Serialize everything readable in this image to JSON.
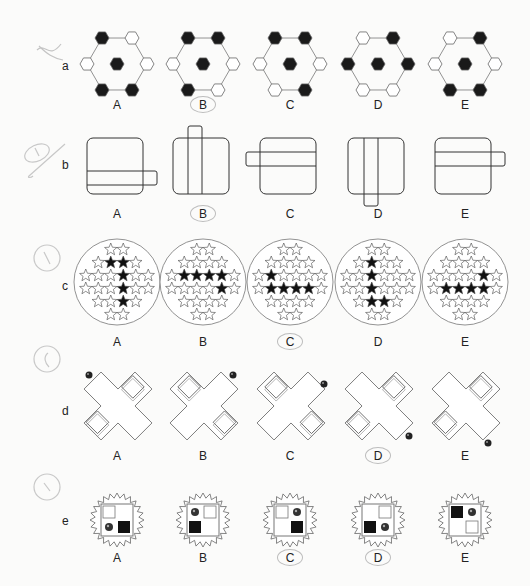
{
  "page": {
    "type": "non-verbal reasoning test page",
    "pencil_marks": {
      "a": "cross",
      "b": "circled 1 with slash",
      "c": "circled 1",
      "d": "circled 1",
      "e": "circled 1"
    }
  },
  "questions": [
    {
      "id": "a",
      "label": "a",
      "kind": "hexagon-ring",
      "circled_answer": "B",
      "options": [
        {
          "label": "A",
          "ring": [
            1,
            0,
            0,
            1,
            1,
            0
          ],
          "center": 1
        },
        {
          "label": "B",
          "ring": [
            1,
            1,
            0,
            0,
            1,
            0
          ],
          "center": 1
        },
        {
          "label": "C",
          "ring": [
            1,
            1,
            0,
            1,
            0,
            0
          ],
          "center": 1
        },
        {
          "label": "D",
          "ring": [
            0,
            1,
            1,
            0,
            0,
            1
          ],
          "center": 1
        },
        {
          "label": "E",
          "ring": [
            0,
            1,
            0,
            1,
            1,
            0
          ],
          "center": 1
        }
      ]
    },
    {
      "id": "b",
      "label": "b",
      "kind": "square-with-band",
      "circled_answer": "B",
      "secondary_mark": "E",
      "options": [
        {
          "label": "A",
          "band": "horizontal-low-right"
        },
        {
          "label": "B",
          "band": "vertical-center-top"
        },
        {
          "label": "C",
          "band": "horizontal-high-left"
        },
        {
          "label": "D",
          "band": "vertical-center-bottom"
        },
        {
          "label": "E",
          "band": "horizontal-high-right"
        }
      ]
    },
    {
      "id": "c",
      "label": "c",
      "kind": "star-grid",
      "circled_answer": "C",
      "secondary_mark": "B",
      "row_sizes": [
        2,
        4,
        6,
        6,
        4,
        2
      ],
      "options": [
        {
          "label": "A",
          "black": [
            [
              1,
              1
            ],
            [
              1,
              2
            ],
            [
              2,
              3
            ],
            [
              3,
              3
            ],
            [
              4,
              2
            ]
          ]
        },
        {
          "label": "B",
          "black": [
            [
              2,
              1
            ],
            [
              2,
              2
            ],
            [
              2,
              3
            ],
            [
              2,
              4
            ],
            [
              3,
              4
            ]
          ]
        },
        {
          "label": "C",
          "black": [
            [
              2,
              1
            ],
            [
              3,
              1
            ],
            [
              3,
              2
            ],
            [
              3,
              3
            ],
            [
              3,
              4
            ]
          ]
        },
        {
          "label": "D",
          "black": [
            [
              1,
              1
            ],
            [
              2,
              2
            ],
            [
              3,
              2
            ],
            [
              4,
              1
            ],
            [
              4,
              2
            ]
          ]
        },
        {
          "label": "E",
          "black": [
            [
              2,
              4
            ],
            [
              3,
              1
            ],
            [
              3,
              2
            ],
            [
              3,
              3
            ],
            [
              3,
              4
            ]
          ]
        }
      ]
    },
    {
      "id": "d",
      "label": "d",
      "kind": "cross-with-ball",
      "circled_answer": "D",
      "secondary_mark": "B",
      "options": [
        {
          "label": "A",
          "ball": "top-left",
          "squares": [
            "top-right",
            "bottom-left"
          ]
        },
        {
          "label": "B",
          "ball": "top-right",
          "squares": [
            "top-left",
            "bottom-right"
          ]
        },
        {
          "label": "C",
          "ball": "right-top",
          "squares": [
            "top-left",
            "bottom-right"
          ]
        },
        {
          "label": "D",
          "ball": "bottom-right",
          "squares": [
            "top-right",
            "bottom-left"
          ]
        },
        {
          "label": "E",
          "ball": "bottom-right-low",
          "squares": [
            "top-right",
            "bottom-left"
          ]
        }
      ]
    },
    {
      "id": "e",
      "label": "e",
      "kind": "zigzag-badge",
      "circled_answer": "D",
      "secondary_mark": "C",
      "options": [
        {
          "label": "A",
          "cells": {
            "tl": "white",
            "tr": "empty",
            "bl": "ball",
            "br": "black"
          }
        },
        {
          "label": "B",
          "cells": {
            "tl": "ball",
            "tr": "white",
            "bl": "black",
            "br": "empty"
          }
        },
        {
          "label": "C",
          "cells": {
            "tl": "white",
            "tr": "ball",
            "bl": "empty",
            "br": "black"
          }
        },
        {
          "label": "D",
          "cells": {
            "tl": "empty",
            "tr": "white",
            "bl": "black",
            "br": "ball"
          }
        },
        {
          "label": "E",
          "cells": {
            "tl": "black",
            "tr": "ball",
            "bl": "empty",
            "br": "white"
          }
        }
      ]
    }
  ],
  "option_x": [
    117,
    203,
    290,
    378,
    465
  ]
}
